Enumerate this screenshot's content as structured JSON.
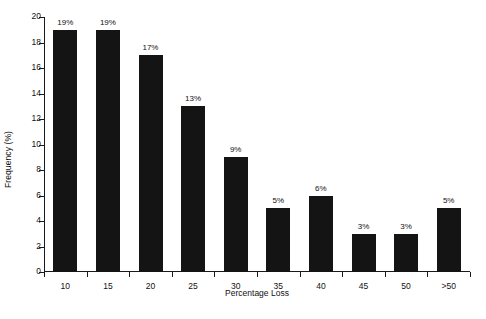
{
  "chart_data": {
    "type": "bar",
    "title": "",
    "subtitle": "",
    "xlabel": "Percentage Loss",
    "ylabel": "Frequency (%)",
    "categories": [
      "10",
      "15",
      "20",
      "25",
      "30",
      "35",
      "40",
      "45",
      "50",
      ">50"
    ],
    "values": [
      19,
      19,
      17,
      13,
      9,
      5,
      6,
      3,
      3,
      5
    ],
    "data_labels": [
      "19%",
      "19%",
      "17%",
      "13%",
      "9%",
      "5%",
      "6%",
      "3%",
      "3%",
      "5%"
    ],
    "ylim": [
      0,
      20
    ],
    "ytick_values": [
      0,
      2,
      4,
      6,
      8,
      10,
      12,
      14,
      16,
      18,
      20
    ],
    "ytick_labels": [
      "0",
      "2",
      "4",
      "6",
      "8",
      "10",
      "12",
      "14",
      "16",
      "18",
      "20"
    ],
    "grid": false,
    "legend": "none",
    "bar_color": "#141414",
    "axis_color": "#1a1a1a",
    "background_color": "#ffffff",
    "tick_direction": "out",
    "spines": [
      "left",
      "bottom"
    ]
  }
}
